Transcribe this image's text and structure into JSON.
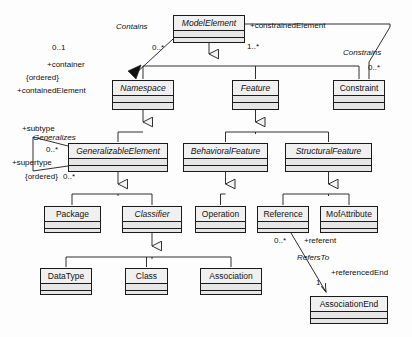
{
  "diagram": {
    "kind": "uml-class-diagram",
    "colors": {
      "box_fill": "#e6e6e6",
      "name_fill": "#f0f0f0",
      "line": "#1a1a1a",
      "background": "#fdfdfd"
    }
  },
  "classes": [
    {
      "id": "model-element",
      "name": "ModelElement",
      "abstract": true,
      "x": 173,
      "y": 15,
      "w": 72,
      "h": 28
    },
    {
      "id": "namespace",
      "name": "Namespace",
      "abstract": true,
      "x": 112,
      "y": 80,
      "w": 62,
      "h": 30
    },
    {
      "id": "feature",
      "name": "Feature",
      "abstract": true,
      "x": 232,
      "y": 80,
      "w": 47,
      "h": 30
    },
    {
      "id": "constraint",
      "name": "Constraint",
      "abstract": false,
      "x": 333,
      "y": 80,
      "w": 52,
      "h": 30
    },
    {
      "id": "generalizable-element",
      "name": "GeneralizableElement",
      "abstract": true,
      "x": 68,
      "y": 143,
      "w": 100,
      "h": 29
    },
    {
      "id": "behavioral-feature",
      "name": "BehavioralFeature",
      "abstract": true,
      "x": 183,
      "y": 143,
      "w": 85,
      "h": 29
    },
    {
      "id": "structural-feature",
      "name": "StructuralFeature",
      "abstract": true,
      "x": 285,
      "y": 143,
      "w": 87,
      "h": 29
    },
    {
      "id": "package",
      "name": "Package",
      "abstract": false,
      "x": 44,
      "y": 206,
      "w": 57,
      "h": 27
    },
    {
      "id": "classifier",
      "name": "Classifier",
      "abstract": true,
      "x": 122,
      "y": 206,
      "w": 60,
      "h": 27
    },
    {
      "id": "operation",
      "name": "Operation",
      "abstract": false,
      "x": 195,
      "y": 206,
      "w": 51,
      "h": 27
    },
    {
      "id": "reference",
      "name": "Reference",
      "abstract": false,
      "x": 257,
      "y": 206,
      "w": 52,
      "h": 27
    },
    {
      "id": "mof-attribute",
      "name": "MofAttribute",
      "abstract": false,
      "x": 320,
      "y": 206,
      "w": 58,
      "h": 27
    },
    {
      "id": "data-type",
      "name": "DataType",
      "abstract": false,
      "x": 40,
      "y": 268,
      "w": 52,
      "h": 27
    },
    {
      "id": "class",
      "name": "Class",
      "abstract": false,
      "x": 125,
      "y": 268,
      "w": 43,
      "h": 27
    },
    {
      "id": "association",
      "name": "Association",
      "abstract": false,
      "x": 200,
      "y": 268,
      "w": 62,
      "h": 27
    },
    {
      "id": "association-end",
      "name": "AssociationEnd",
      "abstract": false,
      "x": 310,
      "y": 296,
      "w": 78,
      "h": 28
    }
  ],
  "associations": [
    {
      "id": "contains",
      "name": "Contains",
      "from": "model-element",
      "to": "namespace",
      "from_role": "+containedElement",
      "from_mult": "0..*",
      "to_role": "+container",
      "to_mult": "0..1",
      "constraint": "{ordered}"
    },
    {
      "id": "constrains",
      "name": "Constrains",
      "from": "model-element",
      "to": "constraint",
      "from_role": "+constrainedElement",
      "from_mult": "1..*",
      "to_role": "",
      "to_mult": "0..*",
      "constraint": ""
    },
    {
      "id": "generalizes",
      "name": "Generalizes",
      "from": "generalizable-element",
      "to": "generalizable-element",
      "from_role": "+subtype",
      "from_mult": "0..*",
      "to_role": "+supertype",
      "to_mult": "0..*",
      "constraint": "{ordered}"
    },
    {
      "id": "refers-to",
      "name": "RefersTo",
      "from": "reference",
      "to": "association-end",
      "from_role": "+referent",
      "from_mult": "0..*",
      "to_role": "+referencedEnd",
      "to_mult": "1",
      "constraint": ""
    }
  ],
  "generalizations": [
    {
      "parent": "model-element",
      "children": [
        "namespace",
        "feature",
        "constraint"
      ]
    },
    {
      "parent": "namespace",
      "children": [
        "generalizable-element"
      ]
    },
    {
      "parent": "feature",
      "children": [
        "behavioral-feature",
        "structural-feature"
      ]
    },
    {
      "parent": "generalizable-element",
      "children": [
        "package",
        "classifier"
      ]
    },
    {
      "parent": "behavioral-feature",
      "children": [
        "operation"
      ]
    },
    {
      "parent": "structural-feature",
      "children": [
        "reference",
        "mof-attribute"
      ]
    },
    {
      "parent": "classifier",
      "children": [
        "data-type",
        "class",
        "association"
      ]
    }
  ],
  "labels": [
    {
      "id": "contains-name",
      "text": "Contains",
      "x": 116,
      "y": 22,
      "italic": true
    },
    {
      "id": "contains-from-mult",
      "text": "0..*",
      "x": 152,
      "y": 43,
      "italic": false
    },
    {
      "id": "container-mult",
      "text": "0..1",
      "x": 52,
      "y": 43,
      "italic": false
    },
    {
      "id": "container-role",
      "text": "+container",
      "x": 47,
      "y": 60,
      "italic": false
    },
    {
      "id": "contains-ordered",
      "text": "{ordered}",
      "x": 26,
      "y": 73,
      "italic": false
    },
    {
      "id": "contained-element-role",
      "text": "+containedElement",
      "x": 17,
      "y": 86,
      "italic": false
    },
    {
      "id": "constrained-elem-role",
      "text": "+constrainedElement",
      "x": 250,
      "y": 21,
      "italic": false
    },
    {
      "id": "constrains-from-mult",
      "text": "1..*",
      "x": 247,
      "y": 42,
      "italic": false
    },
    {
      "id": "constrains-name",
      "text": "Constrains",
      "x": 343,
      "y": 48,
      "italic": true
    },
    {
      "id": "constrains-to-mult",
      "text": "0..*",
      "x": 368,
      "y": 63,
      "italic": false
    },
    {
      "id": "subtype-role",
      "text": "+subtype",
      "x": 22,
      "y": 124,
      "italic": false
    },
    {
      "id": "generalizes-name",
      "text": "Generalizes",
      "x": 33,
      "y": 133,
      "italic": true
    },
    {
      "id": "subtype-mult",
      "text": "0..*",
      "x": 46,
      "y": 145,
      "italic": false
    },
    {
      "id": "supertype-role",
      "text": "+supertype",
      "x": 12,
      "y": 158,
      "italic": false
    },
    {
      "id": "generalizes-ordered",
      "text": "{ordered}",
      "x": 25,
      "y": 172,
      "italic": false
    },
    {
      "id": "supertype-mult",
      "text": "0..*",
      "x": 63,
      "y": 172,
      "italic": false
    },
    {
      "id": "referent-mult",
      "text": "0..*",
      "x": 274,
      "y": 236,
      "italic": false
    },
    {
      "id": "referent-role",
      "text": "+referent",
      "x": 304,
      "y": 236,
      "italic": false
    },
    {
      "id": "refers-to-name",
      "text": "RefersTo",
      "x": 297,
      "y": 253,
      "italic": true
    },
    {
      "id": "referenced-end-role",
      "text": "+referencedEnd",
      "x": 331,
      "y": 268,
      "italic": false
    },
    {
      "id": "referenced-end-mult",
      "text": "1",
      "x": 316,
      "y": 278,
      "italic": false
    }
  ]
}
